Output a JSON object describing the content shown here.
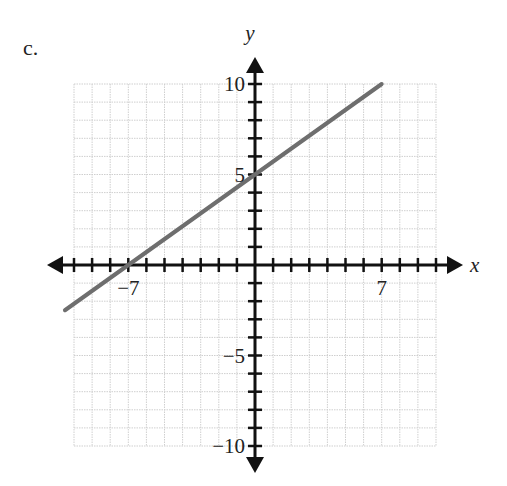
{
  "problem": {
    "label": "c."
  },
  "chart_data": {
    "type": "line",
    "title": "",
    "xlabel": "x",
    "ylabel": "y",
    "xlim": [
      -10,
      10
    ],
    "ylim": [
      -10,
      10
    ],
    "grid": true,
    "x_tick_labels": [
      {
        "value": -7,
        "text": "−7"
      },
      {
        "value": 7,
        "text": "7"
      }
    ],
    "y_tick_labels": [
      {
        "value": 10,
        "text": "10"
      },
      {
        "value": 5,
        "text": "5"
      },
      {
        "value": -5,
        "text": "−5"
      },
      {
        "value": -10,
        "text": "−10"
      }
    ],
    "series": [
      {
        "name": "line",
        "equation": "y = (5/7)x + 5",
        "slope": 0.7143,
        "y_intercept": 5,
        "x_intercept": -7,
        "points": [
          {
            "x": -10.5,
            "y": -2.5
          },
          {
            "x": -7,
            "y": 0
          },
          {
            "x": 0,
            "y": 5
          },
          {
            "x": 7,
            "y": 10
          }
        ],
        "color": "#6e6e6e"
      }
    ]
  },
  "style": {
    "axis_color": "#111111",
    "grid_color": "#cfcfcf",
    "line_color": "#6e6e6e"
  }
}
